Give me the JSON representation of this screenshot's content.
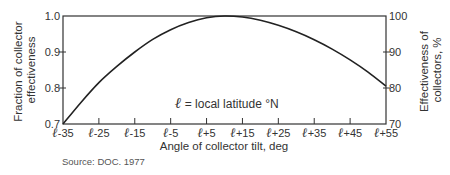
{
  "chart_data": {
    "type": "line",
    "title": "",
    "xlabel": "Angle of collector tilt, deg",
    "ylabel": "Fraction of collector effectiveness",
    "ylabel_lines": [
      "Fraction of collector",
      "effectiveness"
    ],
    "y2label": "Effectiveness of collectors, %",
    "y2label_lines": [
      "Effectiveness of",
      "collectors, %"
    ],
    "x_symbol": "ℓ",
    "x_tick_offsets": [
      -35,
      -25,
      -15,
      -5,
      5,
      15,
      25,
      35,
      45,
      55
    ],
    "x_tick_labels": [
      "ℓ-35",
      "ℓ-25",
      "ℓ-15",
      "ℓ-5",
      "ℓ+5",
      "ℓ+15",
      "ℓ+25",
      "ℓ+35",
      "ℓ+45",
      "ℓ+55"
    ],
    "xlim": [
      -35,
      55
    ],
    "ylim": [
      0.7,
      1.0
    ],
    "y_ticks": [
      0.7,
      0.8,
      0.9,
      1.0
    ],
    "y_tick_labels": [
      "0.7",
      "0.8",
      "0.9",
      "1.0"
    ],
    "y2lim": [
      70,
      100
    ],
    "y2_ticks": [
      70,
      80,
      90,
      100
    ],
    "y2_tick_labels": [
      "70",
      "80",
      "90",
      "100"
    ],
    "grid": false,
    "annotation": "ℓ = local latitude °N",
    "series": [
      {
        "name": "Collector effectiveness",
        "x": [
          -35,
          -30,
          -25,
          -20,
          -15,
          -10,
          -5,
          0,
          5,
          10,
          15,
          20,
          25,
          30,
          35,
          40,
          45,
          50,
          55
        ],
        "values": [
          0.7,
          0.76,
          0.815,
          0.86,
          0.9,
          0.935,
          0.962,
          0.982,
          0.995,
          1.0,
          0.997,
          0.988,
          0.974,
          0.956,
          0.934,
          0.908,
          0.878,
          0.844,
          0.805
        ]
      }
    ]
  },
  "source": "Source: DOC. 1977"
}
